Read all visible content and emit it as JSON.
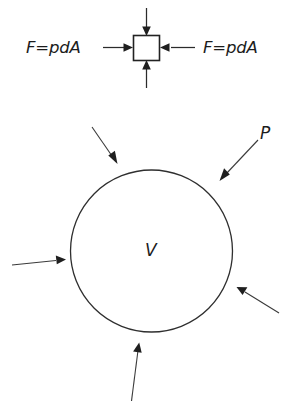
{
  "figure": {
    "background_color": "#ffffff",
    "line_color": "#2b2b2b",
    "text_color": "#1c1c1c"
  },
  "element_diagram": {
    "name": "differential-element",
    "shape": "square",
    "left_force_label": "F=pdA",
    "right_force_label": "F=pdA",
    "arrow_count": 4,
    "arrow_directions": [
      "down",
      "right",
      "left",
      "up"
    ]
  },
  "volume_diagram": {
    "name": "spherical-volume",
    "shape": "circle",
    "volume_label": "V",
    "pressure_label": "P",
    "arrow_count": 5,
    "arrow_directions": [
      "down-right",
      "down-left",
      "right",
      "up-left",
      "up"
    ]
  }
}
